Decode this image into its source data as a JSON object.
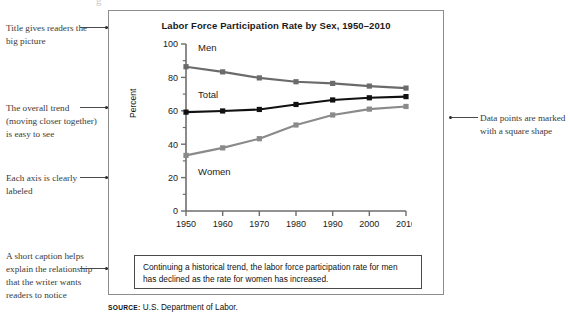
{
  "annotations": {
    "title_note": "Title gives readers the big picture",
    "trend_note": "The overall trend (moving closer together) is easy to see",
    "axis_note": "Each axis is clearly labeled",
    "caption_note": "A short caption helps explain the relationship that the writer wants readers to notice",
    "points_note": "Data points are marked with a square shape"
  },
  "figure": {
    "caption": "Continuing a historical trend, the labor force participation rate for men has declined as the rate for women has increased.",
    "source_label": "SOURCE:",
    "source_text": "U.S. Department of Labor.",
    "top_cut_glyph": "g"
  },
  "chart_data": {
    "type": "line",
    "title": "Labor Force Participation Rate by Sex, 1950–2010",
    "xlabel": "",
    "ylabel": "Percent",
    "x": [
      1950,
      1960,
      1970,
      1980,
      1990,
      2000,
      2010
    ],
    "xtick_labels": [
      "1950",
      "1960",
      "1970",
      "1980",
      "1990",
      "2000",
      "2010"
    ],
    "ytick_labels": [
      "0",
      "20",
      "40",
      "60",
      "80",
      "100"
    ],
    "yticks": [
      0,
      20,
      40,
      60,
      80,
      100
    ],
    "yminor_ticks": [
      10,
      30,
      50,
      70,
      90
    ],
    "ylim": [
      0,
      100
    ],
    "grid": false,
    "legend_position": "inline-labels",
    "marker": "square",
    "series": [
      {
        "name": "Men",
        "label": "Men",
        "color": "#6b6b6b",
        "values": [
          86.4,
          83.3,
          79.7,
          77.4,
          76.4,
          74.8,
          73.6
        ]
      },
      {
        "name": "Total",
        "label": "Total",
        "color": "#111111",
        "values": [
          59.2,
          59.9,
          60.8,
          63.8,
          66.5,
          67.8,
          68.5
        ]
      },
      {
        "name": "Women",
        "label": "Women",
        "color": "#8a8a8a",
        "values": [
          33.3,
          37.8,
          43.3,
          51.5,
          57.5,
          61.0,
          62.6
        ]
      }
    ]
  },
  "colors": {
    "frame": "#8d8d8d",
    "caption_border": "#4a4a4a",
    "axis": "#6e6e6e",
    "text": "#1a1a1a"
  }
}
